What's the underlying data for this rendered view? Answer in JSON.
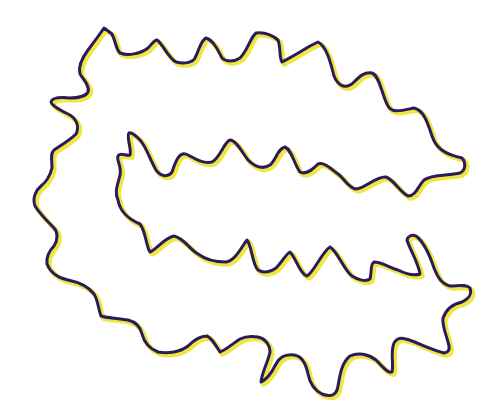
{
  "figure": {
    "background_color": "#ffffff",
    "outline_color": "#2a1a5e",
    "inner_highlight_color": "#f0e640",
    "outline_width": 3,
    "highlight_width": 5,
    "path": "M104,28 L112,34 C116,42 116,50 120,53 C128,56 140,54 148,48 C152,44 154,40 157,40 C163,44 168,58 176,62 C184,64 192,63 195,58 C199,50 201,40 206,38 C213,40 218,50 222,58 C226,62 234,62 240,58 C248,50 250,38 256,33 C264,32 272,35 278,40 C281,48 279,58 282,62 C290,58 300,52 310,46 L318,42 C326,46 330,60 334,76 C338,86 346,90 354,82 C360,76 364,72 372,73 C380,76 382,96 388,106 C392,114 404,110 414,108 C424,110 428,124 432,136 C436,148 444,154 462,158 C466,162 466,170 460,173 C448,176 432,174 424,180 C418,186 416,196 408,196 C400,192 394,180 386,177 C376,176 366,188 356,189 C348,188 344,178 338,174 C330,168 324,162 318,164 C312,170 306,175 300,172 C294,164 292,150 285,147 C278,148 276,160 270,165 C262,170 254,166 248,160 C242,152 236,140 230,140 C224,142 220,158 212,162 C202,164 194,158 188,155 C180,150 176,160 172,172 C168,178 160,176 156,170 C150,160 146,146 140,140 C136,136 132,132 129,133 C126,136 132,150 130,155 C126,156 120,152 118,156 C116,160 122,166 120,175 C118,184 114,192 118,200 C120,212 130,220 140,224 C146,232 146,246 150,252 C156,250 164,238 174,236 C184,238 190,250 198,254 C206,260 214,262 226,262 C236,260 242,246 247,240 C252,246 252,264 258,270 C264,274 270,272 276,268 C282,262 286,254 290,252 C296,258 300,274 307,276 C314,272 322,252 330,247 C338,252 344,270 352,276 C358,280 366,282 370,279 C372,272 370,264 374,262 C382,262 390,268 398,270 C406,274 414,276 420,274 C418,262 410,250 407,240 C408,236 412,234 416,236 C424,242 430,256 434,268 C438,278 442,284 450,286 C458,286 466,284 470,288 C472,294 470,298 462,302 C452,304 446,310 443,318 C442,326 446,334 448,342 C450,348 450,352 444,353 C432,350 420,344 412,341 C404,338 398,336 394,343 C390,352 394,364 392,372 C388,374 382,366 376,360 C368,354 358,352 350,356 C342,362 340,374 338,386 C337,394 332,398 322,394 C314,390 310,384 308,374 C306,364 302,356 294,355 C286,354 280,356 276,364 C272,372 266,380 261,382 C262,372 268,362 270,352 C270,344 264,338 258,337 C252,336 246,336 240,339 C232,344 226,350 220,352 C216,346 212,338 207,336 C200,336 194,340 188,346 C180,352 168,354 158,352 C148,348 144,342 142,334 C140,326 136,322 128,320 C118,318 106,318 101,316 C98,308 98,300 94,294 C88,286 78,282 68,280 C58,278 50,272 47,264 C46,256 50,250 54,246 C58,240 58,232 54,228 C48,222 40,214 35,206 C32,198 36,190 41,186 C46,182 50,176 52,168 C52,160 50,154 54,150 C60,146 70,140 76,134 C80,126 76,118 68,114 C60,110 52,106 51,102 C52,98 60,97 70,98 C78,98 86,96 88,92 C90,86 84,80 80,74 C78,66 82,58 88,50 C94,42 100,34 104,28 Z"
  }
}
